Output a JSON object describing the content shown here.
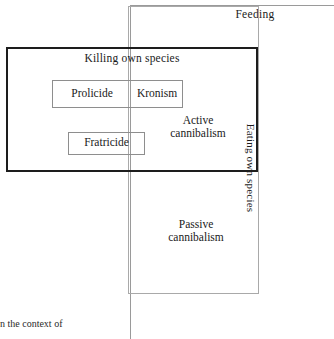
{
  "diagram": {
    "title_caption": "n the context of",
    "regions": {
      "feeding": {
        "label": "Feeding",
        "border_color": "#9a9a9a",
        "kind": "outermost-region"
      },
      "eating_own_species": {
        "label": "Eating own species",
        "border_color": "#a9a9a9",
        "orientation": "vertical",
        "kind": "box"
      },
      "killing_own_species": {
        "label": "Killing own species",
        "border_color": "#1d1d1d",
        "border_weight": "bold",
        "kind": "box"
      }
    },
    "inner_boxes": [
      {
        "label": "Prolicide",
        "border_color": "#8e8e8e"
      },
      {
        "label": "Kronism",
        "border_color": "#8e8e8e"
      },
      {
        "label": "Fratricide",
        "border_color": "#8e8e8e"
      }
    ],
    "free_labels": [
      {
        "line1": "Active",
        "line2": "cannibalism"
      },
      {
        "line1": "Passive",
        "line2": "cannibalism"
      }
    ],
    "active_cannibalism": {
      "line1": "Active",
      "line2": "cannibalism"
    },
    "passive_cannibalism": {
      "line1": "Passive",
      "line2": "cannibalism"
    }
  }
}
